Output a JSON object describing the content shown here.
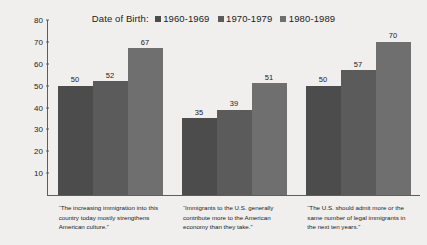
{
  "chart_data": {
    "type": "bar",
    "title": "",
    "subtitle": "",
    "xlabel": "",
    "ylabel": "PERCENT AGREEING",
    "ylim": [
      0,
      80
    ],
    "yticks": [
      80,
      70,
      60,
      50,
      40,
      30,
      20,
      10
    ],
    "grid": false,
    "legend_position": "top-center",
    "legend_title": "Date of Birth:",
    "categories": [
      "“The increasing immigration into this country today mostly strengthens American culture.”",
      "“Immigrants to the U.S. generally contribute more to the American economy than they take.”",
      "“The U.S. should admit more or the same number of legal immigrants in the next ten years.”"
    ],
    "series": [
      {
        "name": "1960-1969",
        "color": "#4c4c4c",
        "values": [
          50,
          35,
          50
        ]
      },
      {
        "name": "1970-1979",
        "color": "#5b5b5b",
        "values": [
          52,
          39,
          57
        ]
      },
      {
        "name": "1980-1989",
        "color": "#6f6f6f",
        "values": [
          67,
          51,
          70
        ]
      }
    ]
  },
  "axis": {
    "y_title": "PERCENT AGREEING",
    "ticks": [
      "80",
      "70",
      "60",
      "50",
      "40",
      "30",
      "20",
      "10"
    ]
  },
  "legend": {
    "title": "Date of Birth:",
    "entries": [
      {
        "label": "1960-1969",
        "color": "#4c4c4c"
      },
      {
        "label": "1970-1979",
        "color": "#5b5b5b"
      },
      {
        "label": "1980-1989",
        "color": "#6f6f6f"
      }
    ]
  },
  "groups": [
    {
      "caption": "“The increasing immigration into this country today mostly strengthens American culture.”",
      "bars": [
        {
          "series": "1960-1969",
          "value": "50"
        },
        {
          "series": "1970-1979",
          "value": "52"
        },
        {
          "series": "1980-1989",
          "value": "67"
        }
      ]
    },
    {
      "caption": "“Immigrants to the U.S. generally contribute more to the American economy than they take.”",
      "bars": [
        {
          "series": "1960-1969",
          "value": "35"
        },
        {
          "series": "1970-1979",
          "value": "39"
        },
        {
          "series": "1980-1989",
          "value": "51"
        }
      ]
    },
    {
      "caption": "“The U.S. should admit more or the same number of legal immigrants in the next ten years.”",
      "bars": [
        {
          "series": "1960-1969",
          "value": "50"
        },
        {
          "series": "1970-1979",
          "value": "57"
        },
        {
          "series": "1980-1989",
          "value": "70"
        }
      ]
    }
  ]
}
